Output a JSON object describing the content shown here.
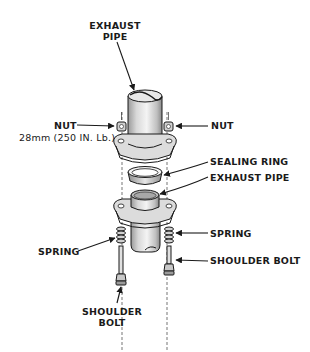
{
  "diagram": {
    "type": "exploded-view",
    "line_color": "#1a1a1a",
    "shade_color": "#bdbdbd",
    "highlight_color": "#f2f2f2"
  },
  "labels": {
    "exhaust_pipe_top": {
      "line1": "EXHAUST",
      "line2": "PIPE"
    },
    "nut_left": "NUT",
    "nut_torque": "28mm (250 IN. Lb.)",
    "nut_right": "NUT",
    "sealing_ring": "SEALING RING",
    "exhaust_pipe_lower": "EXHAUST PIPE",
    "spring_left": "SPRING",
    "spring_right": "SPRING",
    "shoulder_bolt_right": "SHOULDER BOLT",
    "shoulder_bolt_bottom": {
      "line1": "SHOULDER",
      "line2": "BOLT"
    }
  }
}
